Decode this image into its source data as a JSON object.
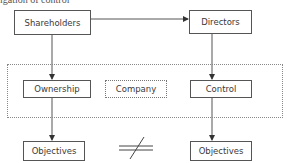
{
  "header": {
    "cut_text": "igation of control"
  },
  "diagram": {
    "nodes": {
      "shareholders": "Shareholders",
      "directors": "Directors",
      "ownership": "Ownership",
      "company": "Company",
      "control": "Control",
      "objectives_left": "Objectives",
      "objectives_right": "Objectives"
    },
    "edges": [
      {
        "from": "shareholders",
        "to": "directors"
      },
      {
        "from": "shareholders",
        "to": "ownership"
      },
      {
        "from": "directors",
        "to": "control"
      },
      {
        "from": "ownership",
        "to": "objectives_left"
      },
      {
        "from": "control",
        "to": "objectives_right"
      }
    ],
    "relation_symbol": "not-equal",
    "group": {
      "label": "company-boundary",
      "style": "dotted"
    },
    "colors": {
      "line": "#555555",
      "dotted": "#888888",
      "text": "#3a3a3a"
    }
  }
}
